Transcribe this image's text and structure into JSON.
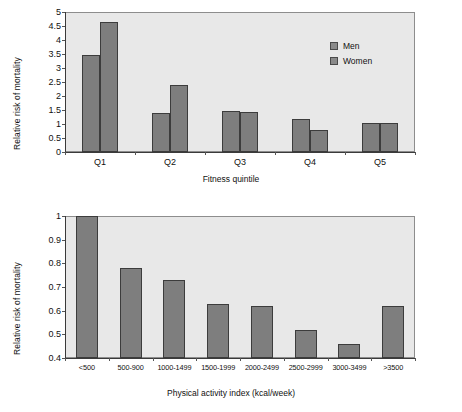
{
  "chart_data": [
    {
      "type": "bar",
      "id": "fitness-quintile-chart",
      "title": "",
      "xlabel": "Fitness quintile",
      "ylabel": "Relative risk of mortality",
      "categories": [
        "Q1",
        "Q2",
        "Q3",
        "Q4",
        "Q5"
      ],
      "series": [
        {
          "name": "Men",
          "values": [
            3.45,
            1.4,
            1.47,
            1.17,
            1.02
          ]
        },
        {
          "name": "Women",
          "values": [
            4.65,
            2.4,
            1.43,
            0.78,
            1.02
          ]
        }
      ],
      "legend": [
        "Men",
        "Women"
      ],
      "legend_position": "top-right inside plot",
      "ylim": [
        0,
        5
      ],
      "yticks": [
        "0",
        "0.5",
        "1",
        "1.5",
        "2",
        "2.5",
        "3",
        "3.5",
        "4",
        "4.5",
        "5"
      ],
      "ytick_values": [
        0,
        0.5,
        1,
        1.5,
        2,
        2.5,
        3,
        3.5,
        4,
        4.5,
        5
      ],
      "grid": false,
      "bar_color": "#7e7e7e",
      "plot_background": "#e8e8e8"
    },
    {
      "type": "bar",
      "id": "physical-activity-index-chart",
      "title": "",
      "xlabel": "Physical activity index (kcal/week)",
      "ylabel": "Relative risk of mortality",
      "categories": [
        "<500",
        "500-900",
        "1000-1499",
        "1500-1999",
        "2000-2499",
        "2500-2999",
        "3000-3499",
        ">3500"
      ],
      "values": [
        1.0,
        0.78,
        0.73,
        0.63,
        0.62,
        0.52,
        0.46,
        0.62
      ],
      "ylim": [
        0.4,
        1
      ],
      "yticks": [
        "0.4",
        "0.5",
        "0.6",
        "0.7",
        "0.8",
        "0.9",
        "1"
      ],
      "ytick_values": [
        0.4,
        0.5,
        0.6,
        0.7,
        0.8,
        0.9,
        1
      ],
      "grid": false,
      "legend": [],
      "bar_color": "#7e7e7e",
      "plot_background": "#e8e8e8"
    }
  ]
}
